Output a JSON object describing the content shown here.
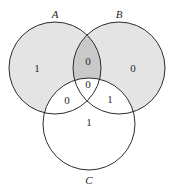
{
  "diagram": {
    "type": "venn-3",
    "colors": {
      "set_fill": "#e4e4e4",
      "ab_only_fill": "#c9c9c9",
      "stroke": "#2b2b2b",
      "background": "#ffffff"
    },
    "sets": [
      {
        "name": "A",
        "cx": 55,
        "cy": 68,
        "r": 46,
        "label_x": 55,
        "label_y": 18,
        "shaded": true
      },
      {
        "name": "B",
        "cx": 119,
        "cy": 68,
        "r": 46,
        "label_x": 119,
        "label_y": 18,
        "shaded": true
      },
      {
        "name": "C",
        "cx": 89,
        "cy": 124,
        "r": 46,
        "label_x": 89,
        "label_y": 184,
        "shaded": false
      }
    ],
    "regions": {
      "a_only": {
        "value": "1",
        "x": 37,
        "y": 72
      },
      "b_only": {
        "value": "0",
        "x": 133,
        "y": 72
      },
      "c_only": {
        "value": "1",
        "x": 89,
        "y": 126
      },
      "ab_only": {
        "value": "0",
        "x": 88,
        "y": 65
      },
      "ac_only": {
        "value": "0",
        "x": 67,
        "y": 104
      },
      "bc_only": {
        "value": "1",
        "x": 110,
        "y": 103
      },
      "abc": {
        "value": "0",
        "x": 88,
        "y": 88
      }
    }
  }
}
